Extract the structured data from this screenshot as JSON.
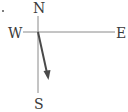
{
  "compass": {
    "labels": {
      "north": "N",
      "south": "S",
      "east": "E",
      "west": "W"
    },
    "axis_color": "#8a8a8a",
    "arrow_color": "#4a4a4a",
    "label_color": "#3a3a3a",
    "vector": {
      "direction": "south-southeast",
      "origin": "center"
    }
  }
}
